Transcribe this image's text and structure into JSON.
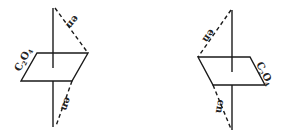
{
  "diagram": {
    "colors": {
      "line": "#1a1a1a",
      "background": "#ffffff"
    },
    "left": {
      "oxalate_label": {
        "main": "C",
        "sub1": "2",
        "mid": "O",
        "sub2": "4"
      },
      "en_top_label": "en",
      "en_bottom_label": "en"
    },
    "right": {
      "oxalate_label": {
        "main": "C",
        "sub1": "2",
        "mid": "O",
        "sub2": "4"
      },
      "en_top_label": "en",
      "en_bottom_label": "en"
    }
  }
}
